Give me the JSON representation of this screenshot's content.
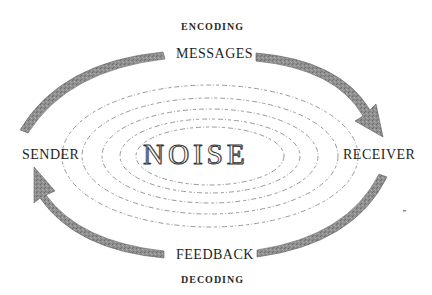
{
  "diagram": {
    "type": "communication-cycle",
    "labels": {
      "encoding": "ENCODING",
      "messages": "MESSAGES",
      "sender": "SENDER",
      "receiver": "RECEIVER",
      "feedback": "FEEDBACK",
      "decoding": "DECODING",
      "noise": "NOISE"
    },
    "flows": [
      {
        "from": "SENDER",
        "to": "RECEIVER",
        "via": "MESSAGES",
        "process": "ENCODING",
        "position": "top"
      },
      {
        "from": "RECEIVER",
        "to": "SENDER",
        "via": "FEEDBACK",
        "process": "DECODING",
        "position": "bottom"
      }
    ],
    "center": "NOISE",
    "noise_rings": 5,
    "colors": {
      "arrow": "#8a8a8a",
      "arrow_edge": "#5e5e5e",
      "text": "#1e1e1e",
      "rings": "#8c8c8c",
      "background": "#ffffff"
    }
  }
}
